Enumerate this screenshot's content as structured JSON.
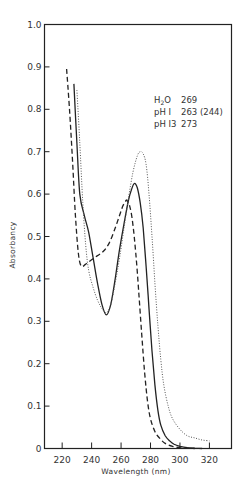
{
  "chart_data": {
    "type": "line",
    "title": "",
    "xlabel": "Wavelength (nm)",
    "ylabel": "Absorbancy",
    "xlim": [
      208,
      335
    ],
    "ylim": [
      0,
      1.0
    ],
    "grid": false,
    "x_ticks": [
      220,
      240,
      260,
      280,
      300,
      320
    ],
    "x_tick_labels": [
      "220",
      "240",
      "260",
      "280",
      "300",
      "320"
    ],
    "y_ticks": [
      0,
      0.1,
      0.2,
      0.3,
      0.4,
      0.5,
      0.6,
      0.7,
      0.8,
      0.9,
      1.0
    ],
    "y_tick_labels": [
      "0",
      "0.1",
      "0.2",
      "0.3",
      "0.4",
      "0.5",
      "0.6",
      "0.7",
      "0.8",
      "0.9",
      "1.0"
    ],
    "legend": {
      "position": "upper right (inside)",
      "entries": [
        {
          "label_main": "H",
          "label_sub": "2",
          "label_rest": "O",
          "value": "269"
        },
        {
          "label_main": "pH I",
          "label_sub": "",
          "label_rest": "",
          "value": "263 (244)"
        },
        {
          "label_main": "pH I3",
          "label_sub": "",
          "label_rest": "",
          "value": "273"
        }
      ]
    },
    "series": [
      {
        "name": "H2O",
        "style": "solid",
        "lambda_max": 269,
        "x": [
          228,
          230,
          232,
          235,
          238,
          241,
          244,
          247,
          250,
          253,
          256,
          259,
          262,
          265,
          267,
          269,
          271,
          273,
          275,
          277,
          279,
          281,
          283,
          285,
          287,
          290,
          293,
          296,
          300,
          305,
          310,
          315
        ],
        "y": [
          0.86,
          0.72,
          0.6,
          0.55,
          0.51,
          0.45,
          0.39,
          0.34,
          0.315,
          0.34,
          0.4,
          0.47,
          0.53,
          0.585,
          0.61,
          0.625,
          0.615,
          0.58,
          0.52,
          0.43,
          0.33,
          0.23,
          0.15,
          0.09,
          0.055,
          0.03,
          0.018,
          0.01,
          0.005,
          0.002,
          0.001,
          0.0
        ]
      },
      {
        "name": "pH 1",
        "style": "dashed",
        "lambda_max": 263,
        "shoulder": 244,
        "x": [
          223,
          225,
          227,
          229,
          231,
          233,
          236,
          240,
          244,
          248,
          252,
          256,
          259,
          261,
          263,
          264,
          266,
          268,
          270,
          272,
          274,
          276,
          278,
          280,
          283,
          286,
          290,
          295,
          300,
          305,
          310
        ],
        "y": [
          0.895,
          0.8,
          0.68,
          0.55,
          0.46,
          0.43,
          0.435,
          0.445,
          0.455,
          0.465,
          0.485,
          0.52,
          0.55,
          0.57,
          0.583,
          0.585,
          0.57,
          0.53,
          0.46,
          0.37,
          0.27,
          0.18,
          0.11,
          0.07,
          0.04,
          0.025,
          0.012,
          0.005,
          0.002,
          0.001,
          0.0
        ]
      },
      {
        "name": "pH 13",
        "style": "dotted",
        "lambda_max": 273,
        "x": [
          230,
          232,
          234,
          236,
          238,
          241,
          244,
          247,
          250,
          253,
          256,
          259,
          262,
          265,
          268,
          271,
          273,
          275,
          277,
          279,
          281,
          283,
          285,
          287,
          289,
          292,
          295,
          300,
          305,
          310,
          315,
          320
        ],
        "y": [
          0.845,
          0.72,
          0.58,
          0.48,
          0.42,
          0.38,
          0.35,
          0.33,
          0.32,
          0.34,
          0.39,
          0.45,
          0.52,
          0.59,
          0.65,
          0.69,
          0.7,
          0.695,
          0.67,
          0.6,
          0.5,
          0.39,
          0.29,
          0.21,
          0.15,
          0.1,
          0.07,
          0.045,
          0.03,
          0.025,
          0.02,
          0.018
        ]
      }
    ]
  }
}
